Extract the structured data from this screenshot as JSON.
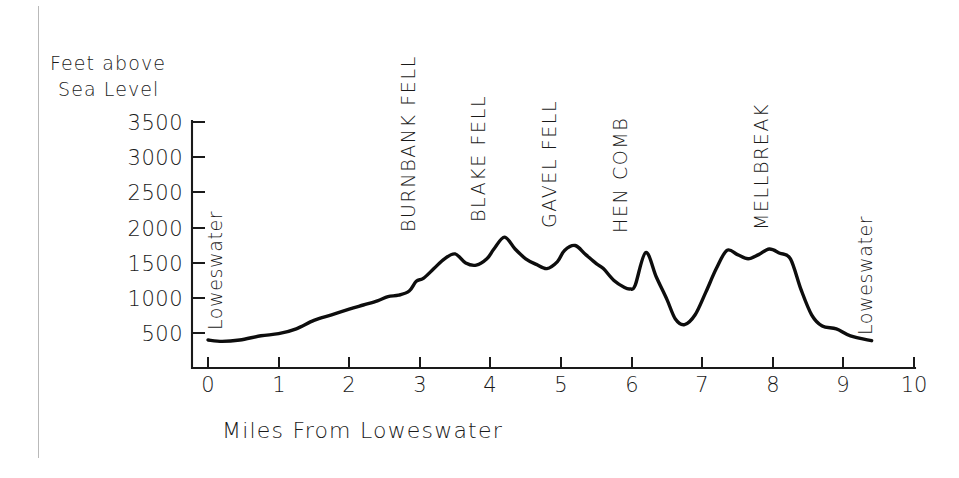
{
  "chart_data": {
    "type": "line",
    "title": "",
    "xlabel": "Miles From Loweswater",
    "ylabel": "Feet above Sea Level",
    "ylabel_line1": "Feet above",
    "ylabel_line2": "Sea Level",
    "xlim": [
      0,
      10
    ],
    "ylim": [
      0,
      3500
    ],
    "grid": false,
    "legend": "none",
    "x_ticks": [
      0,
      1,
      2,
      3,
      4,
      5,
      6,
      7,
      8,
      9,
      10
    ],
    "x_tick_labels": [
      "0",
      "1",
      "2",
      "3",
      "4",
      "5",
      "6",
      "7",
      "8",
      "9",
      "10"
    ],
    "y_ticks": [
      500,
      1000,
      1500,
      2000,
      2500,
      3000,
      3500
    ],
    "y_tick_labels": [
      "500",
      "1000",
      "1500",
      "2000",
      "2500",
      "3000",
      "3500"
    ],
    "series": [
      {
        "name": "Elevation profile",
        "x": [
          0.0,
          0.2,
          0.45,
          0.75,
          1.0,
          1.25,
          1.5,
          1.75,
          2.0,
          2.2,
          2.4,
          2.55,
          2.7,
          2.85,
          2.95,
          3.05,
          3.2,
          3.35,
          3.5,
          3.65,
          3.8,
          3.95,
          4.05,
          4.2,
          4.35,
          4.5,
          4.65,
          4.8,
          4.95,
          5.05,
          5.2,
          5.35,
          5.5,
          5.6,
          5.75,
          5.9,
          5.98,
          6.05,
          6.2,
          6.35,
          6.5,
          6.62,
          6.75,
          6.9,
          7.05,
          7.2,
          7.35,
          7.5,
          7.65,
          7.8,
          7.95,
          8.1,
          8.25,
          8.4,
          8.55,
          8.7,
          8.9,
          9.1,
          9.4
        ],
        "y": [
          400,
          380,
          400,
          460,
          490,
          560,
          680,
          760,
          840,
          900,
          960,
          1020,
          1040,
          1100,
          1240,
          1280,
          1420,
          1560,
          1630,
          1500,
          1470,
          1560,
          1700,
          1870,
          1700,
          1560,
          1480,
          1420,
          1520,
          1680,
          1750,
          1620,
          1490,
          1420,
          1250,
          1150,
          1130,
          1180,
          1650,
          1300,
          980,
          700,
          620,
          760,
          1080,
          1420,
          1680,
          1620,
          1560,
          1620,
          1700,
          1640,
          1560,
          1120,
          760,
          600,
          560,
          460,
          390
        ]
      }
    ],
    "peak_labels": [
      {
        "text": "BURNBANK FELL",
        "x": 3.0,
        "y": 1630
      },
      {
        "text": "BLAKE FELL",
        "x": 4.0,
        "y": 1870
      },
      {
        "text": "GAVEL FELL",
        "x": 5.0,
        "y": 1750
      },
      {
        "text": "HEN COMB",
        "x": 6.0,
        "y": 1650
      },
      {
        "text": "MELLBREAK",
        "x": 8.0,
        "y": 1700
      }
    ],
    "lake_labels": [
      {
        "text": "Loweswater",
        "x": 0.1,
        "y": 400,
        "position": "left-start"
      },
      {
        "text": "Loweswater",
        "x": 9.35,
        "y": 390,
        "position": "right-end"
      }
    ],
    "annotations": [
      "Elevation profile of a circular fell walk from Loweswater",
      "Maximum summit: Blake Fell at approximately 1870 feet",
      "Lowest valley between Hen Comb and Mellbreak at approximately 620 feet"
    ]
  },
  "axis": {
    "y_title_line1": "Feet above",
    "y_title_line2": "Sea Level",
    "x_title": "Miles From Loweswater"
  },
  "colors": {
    "line": "#0d0d0d",
    "axis": "#1a1a1a",
    "background": "#ffffff",
    "scan_line": "#b9b9b9"
  }
}
